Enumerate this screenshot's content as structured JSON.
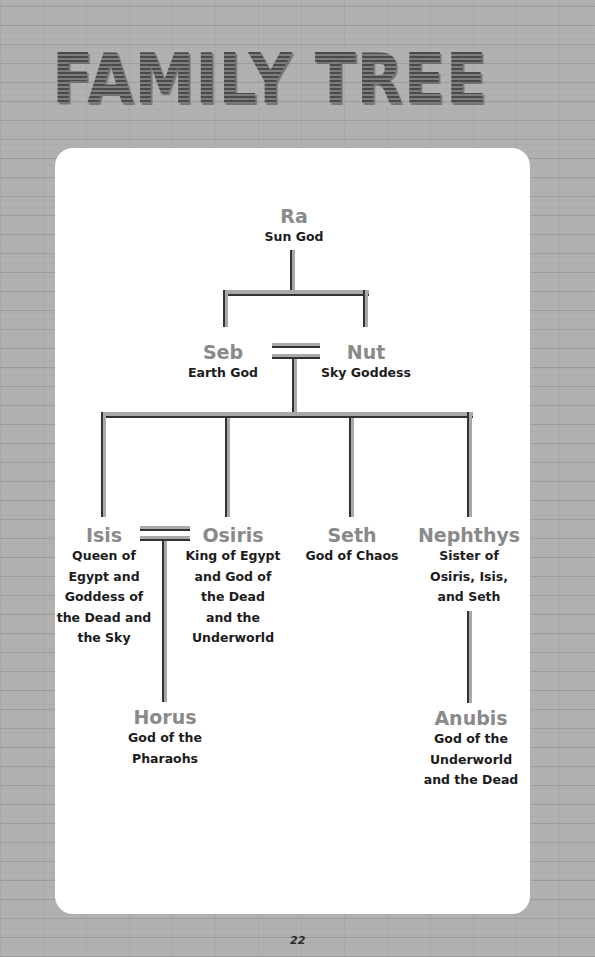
{
  "page": {
    "title": "FAMILY TREE",
    "page_number": "22"
  },
  "tree": {
    "ra": {
      "name": "Ra",
      "desc": [
        "Sun God"
      ]
    },
    "seb": {
      "name": "Seb",
      "desc": [
        "Earth God"
      ]
    },
    "nut": {
      "name": "Nut",
      "desc": [
        "Sky Goddess"
      ]
    },
    "isis": {
      "name": "Isis",
      "desc": [
        "Queen of",
        "Egypt and",
        "Goddess of",
        "the Dead and",
        "the Sky"
      ]
    },
    "osiris": {
      "name": "Osiris",
      "desc": [
        "King of Egypt",
        "and God of",
        "the Dead",
        "and the",
        "Underworld"
      ]
    },
    "seth": {
      "name": "Seth",
      "desc": [
        "God of Chaos"
      ]
    },
    "nephthys": {
      "name": "Nephthys",
      "desc": [
        "Sister of",
        "Osiris, Isis,",
        "and Seth"
      ]
    },
    "horus": {
      "name": "Horus",
      "desc": [
        "God of the",
        "Pharaohs"
      ]
    },
    "anubis": {
      "name": "Anubis",
      "desc": [
        "God of the",
        "Underworld",
        "and the Dead"
      ]
    }
  },
  "relationships": [
    {
      "type": "parent-child",
      "parent": "Ra",
      "children": [
        "Seb",
        "Nut"
      ]
    },
    {
      "type": "marriage",
      "partners": [
        "Seb",
        "Nut"
      ]
    },
    {
      "type": "parent-child",
      "parents": [
        "Seb",
        "Nut"
      ],
      "children": [
        "Isis",
        "Osiris",
        "Seth",
        "Nephthys"
      ]
    },
    {
      "type": "marriage",
      "partners": [
        "Isis",
        "Osiris"
      ]
    },
    {
      "type": "parent-child",
      "parents": [
        "Isis",
        "Osiris"
      ],
      "children": [
        "Horus"
      ]
    },
    {
      "type": "parent-child",
      "parent": "Nephthys",
      "children": [
        "Anubis"
      ]
    }
  ],
  "colors": {
    "background": "#b1b1b1",
    "card": "#ffffff",
    "name_text": "#8a8a8a",
    "desc_text": "#1c1c1c",
    "connector": "#a9a9a9",
    "connector_shadow": "#333333"
  }
}
